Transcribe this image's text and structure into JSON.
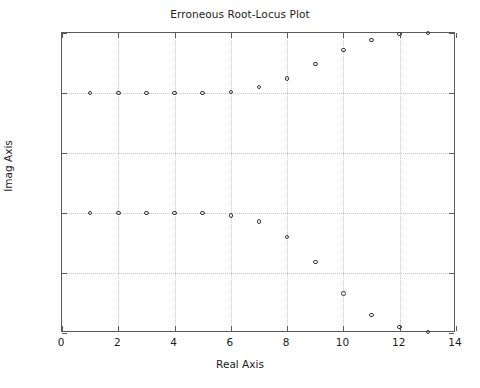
{
  "chart_data": {
    "type": "scatter",
    "title": "Erroneous Root-Locus Plot",
    "xlabel": "Real Axis",
    "ylabel": "Imag Axis",
    "xlim": [
      0,
      14
    ],
    "ylim": [
      -3,
      -0.5
    ],
    "grid": true,
    "legend": null,
    "marker_style": "open-circle",
    "marker_color": "#3a3a3a",
    "xticks": [
      0,
      2,
      4,
      6,
      8,
      10,
      12,
      14
    ],
    "xticklabels": [
      "0",
      "2",
      "4",
      "6",
      "8",
      "10",
      "12",
      "14"
    ],
    "yticks": [
      -0.5,
      -1,
      -1.5,
      -2,
      -2.5,
      -3
    ],
    "yticklabels": [
      "-0.5",
      "-1",
      "-1.5",
      "-2",
      "-2.5",
      "-3"
    ],
    "series": [
      {
        "name": "upper-branch",
        "x": [
          1,
          2,
          3,
          4,
          5,
          6,
          7,
          8,
          9,
          10,
          11,
          12,
          13
        ],
        "y": [
          -1.0,
          -1.0,
          -1.0,
          -1.0,
          -1.0,
          -0.99,
          -0.95,
          -0.88,
          -0.76,
          -0.64,
          -0.56,
          -0.51,
          -0.5
        ]
      },
      {
        "name": "lower-branch",
        "x": [
          1,
          2,
          3,
          4,
          5,
          6,
          7,
          8,
          9,
          10,
          11,
          12,
          13
        ],
        "y": [
          -2.0,
          -2.0,
          -2.0,
          -2.0,
          -2.0,
          -2.02,
          -2.07,
          -2.2,
          -2.41,
          -2.67,
          -2.85,
          -2.95,
          -2.99
        ]
      }
    ]
  },
  "colors": {
    "axis": "#5a5a5a",
    "grid": "#c9c9c9",
    "text": "#1c1c1c",
    "marker": "#3a3a3a",
    "background": "#ffffff"
  }
}
